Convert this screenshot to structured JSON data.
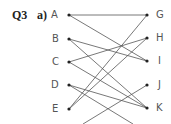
{
  "question": {
    "number": "Q3",
    "part": "a)"
  },
  "left_nodes": [
    {
      "label": "A",
      "x": 69,
      "y": 15
    },
    {
      "label": "B",
      "x": 69,
      "y": 39
    },
    {
      "label": "C",
      "x": 69,
      "y": 62
    },
    {
      "label": "D",
      "x": 69,
      "y": 85
    },
    {
      "label": "E",
      "x": 69,
      "y": 109
    }
  ],
  "right_nodes": [
    {
      "label": "G",
      "x": 147,
      "y": 15
    },
    {
      "label": "H",
      "x": 147,
      "y": 38
    },
    {
      "label": "I",
      "x": 147,
      "y": 61
    },
    {
      "label": "J",
      "x": 147,
      "y": 85
    },
    {
      "label": "K",
      "x": 147,
      "y": 108
    }
  ],
  "edges": [
    {
      "from": "A",
      "to": "G"
    },
    {
      "from": "A",
      "to": "I"
    },
    {
      "from": "B",
      "to": "I"
    },
    {
      "from": "B",
      "to": "K"
    },
    {
      "from": "C",
      "to": "H"
    },
    {
      "from": "C",
      "to": "K"
    },
    {
      "from": "D",
      "to": "K"
    },
    {
      "from": "D",
      "to": "offscreen",
      "x2": 133,
      "y2": 124
    },
    {
      "from": "E",
      "to": "G"
    },
    {
      "from": "E",
      "to": "H"
    },
    {
      "from": "J",
      "to": "offscreen",
      "x2": 83,
      "y2": 124
    }
  ],
  "colors": {
    "line": "#555555",
    "dot": "#222222",
    "label": "#555555"
  }
}
